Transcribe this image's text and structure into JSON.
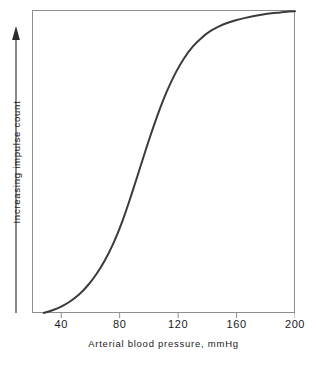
{
  "chart_data": {
    "type": "line",
    "title": "",
    "subtitle": "",
    "xlabel": "Arterial blood pressure, mmHg",
    "ylabel": "Increasing impulse count",
    "ylabel_arrow": "up-arrow",
    "xlim": [
      20,
      200
    ],
    "ylim": [
      0,
      1
    ],
    "grid": false,
    "legend": null,
    "xticks": [
      40,
      80,
      120,
      160,
      200
    ],
    "xtick_labels": [
      "40",
      "80",
      "120",
      "160",
      "200"
    ],
    "yticks": [],
    "ytick_labels": [],
    "y_axis_note": "unlabeled relative scale, arrow denotes increasing direction",
    "series": [
      {
        "name": "Baroreceptor impulse count",
        "color": "#3b3b3b",
        "linewidth": 2,
        "x": [
          28,
          34,
          40,
          46,
          52,
          58,
          64,
          70,
          76,
          82,
          88,
          94,
          100,
          106,
          112,
          118,
          124,
          130,
          136,
          142,
          148,
          154,
          160,
          166,
          172,
          178,
          184,
          190,
          196,
          200
        ],
        "y": [
          0.0,
          0.009,
          0.021,
          0.038,
          0.06,
          0.09,
          0.128,
          0.175,
          0.233,
          0.305,
          0.39,
          0.48,
          0.57,
          0.654,
          0.728,
          0.79,
          0.84,
          0.879,
          0.908,
          0.93,
          0.946,
          0.958,
          0.967,
          0.974,
          0.98,
          0.985,
          0.989,
          0.992,
          0.995,
          0.996
        ]
      }
    ],
    "annotations": []
  },
  "axes": {
    "x_tick_labels": [
      "40",
      "80",
      "120",
      "160",
      "200"
    ],
    "x_title": "Arterial blood pressure, mmHg",
    "y_title": "Increasing impulse count"
  },
  "colors": {
    "curve": "#3b3b3b",
    "frame": "#8e8e8e",
    "text": "#1a1a1a",
    "background": "#ffffff"
  }
}
